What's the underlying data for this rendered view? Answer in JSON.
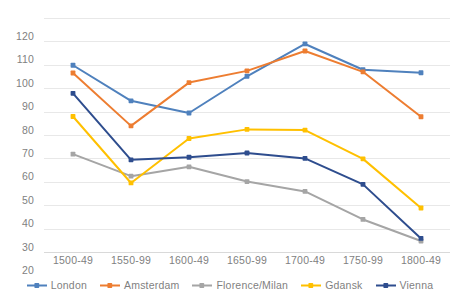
{
  "chart_data": {
    "type": "line",
    "title": "",
    "subtitle": "",
    "xlabel": "",
    "ylabel": "",
    "categories": [
      "1500-49",
      "1550-99",
      "1600-49",
      "1650-99",
      "1700-49",
      "1750-99",
      "1800-49"
    ],
    "ylim": [
      20,
      120
    ],
    "y_ticks": [
      20,
      30,
      40,
      50,
      60,
      70,
      80,
      90,
      100,
      110,
      120
    ],
    "grid": "horizontal",
    "legend_position": "bottom",
    "markers": true,
    "series": [
      {
        "name": "London",
        "color": "#4f81bd",
        "values": [
          99.8,
          84.6,
          79.4,
          95.1,
          108.9,
          97.9,
          96.6
        ]
      },
      {
        "name": "Amsterdam",
        "color": "#ed7d31",
        "values": [
          96.5,
          73.9,
          92.4,
          97.4,
          105.9,
          97.0,
          77.8
        ]
      },
      {
        "name": "Florence/Milan",
        "color": "#a5a5a5",
        "values": [
          61.8,
          52.4,
          56.4,
          50.1,
          45.9,
          33.9,
          24.7
        ]
      },
      {
        "name": "Gdansk",
        "color": "#ffc000",
        "values": [
          77.9,
          49.5,
          68.5,
          72.4,
          72.1,
          59.8,
          38.8
        ]
      },
      {
        "name": "Vienna",
        "color": "#2e4d8e",
        "values": [
          87.8,
          59.4,
          60.5,
          62.3,
          60.0,
          48.9,
          25.8
        ]
      }
    ]
  },
  "legend": {
    "items": [
      {
        "label": "London",
        "color": "#4f81bd"
      },
      {
        "label": "Amsterdam",
        "color": "#ed7d31"
      },
      {
        "label": "Florence/Milan",
        "color": "#a5a5a5"
      },
      {
        "label": "Gdansk",
        "color": "#ffc000"
      },
      {
        "label": "Vienna",
        "color": "#2e4d8e"
      }
    ]
  }
}
